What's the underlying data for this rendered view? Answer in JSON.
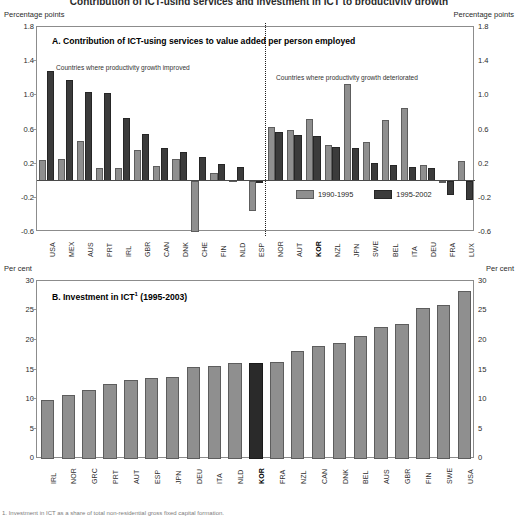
{
  "figure": {
    "title_fragment": "Contribution of ICT-using services and investment in ICT to productivity growth",
    "footer_fragment": "1. Investment in ICT as a share of total non-residential gross fixed capital formation."
  },
  "panelA": {
    "title": "A. Contribution of ICT-using services to value added per person employed",
    "unit_left": "Percentage points",
    "unit_right": "Percentage points",
    "note_left": "Countries where productivity growth improved",
    "note_right": "Countries where productivity growth deteriorated",
    "yticks": [
      "1.8",
      "1.4",
      "1.0",
      "0.6",
      "0.2",
      "-0.2",
      "-0.6"
    ],
    "legend": [
      {
        "label": "1990-1995",
        "style": "light"
      },
      {
        "label": "1995-2002",
        "style": "dark"
      }
    ]
  },
  "panelB": {
    "title": "B. Investment in ICT¹ (1995-2003)",
    "title_main": "B. Investment in ICT",
    "title_sup": "1",
    "title_tail": " (1995-2003)",
    "unit_left": "Per cent",
    "unit_right": "Per cent",
    "yticks": [
      "30",
      "25",
      "20",
      "15",
      "10",
      "5",
      "0"
    ]
  },
  "chart_data": [
    {
      "type": "bar",
      "title": "A. Contribution of ICT-using services to value added per person employed",
      "xlabel": "",
      "ylabel": "Percentage points",
      "ylim": [
        -0.6,
        1.8
      ],
      "yticks": [
        -0.6,
        -0.2,
        0.2,
        0.6,
        1.0,
        1.4,
        1.8
      ],
      "grid": false,
      "legend_position": "inside-bottom-right",
      "annotations": [
        "Countries where productivity growth improved",
        "Countries where productivity growth deteriorated"
      ],
      "group_split_after": "ESP",
      "categories": [
        "USA",
        "MEX",
        "AUS",
        "PRT",
        "IRL",
        "GBR",
        "CAN",
        "DNK",
        "CHE",
        "FIN",
        "NLD",
        "ESP",
        "NOR",
        "AUT",
        "KOR",
        "NZL",
        "JPN",
        "SWE",
        "BEL",
        "ITA",
        "DEU",
        "FRA",
        "LUX"
      ],
      "series": [
        {
          "name": "1990-1995",
          "color": "#8f8f8f",
          "values": [
            0.24,
            0.25,
            0.47,
            0.15,
            0.15,
            0.36,
            0.17,
            0.25,
            -0.6,
            0.09,
            0.0,
            -0.35,
            0.63,
            0.6,
            0.72,
            0.42,
            1.13,
            0.45,
            0.71,
            0.85,
            0.19,
            -0.02,
            0.23
          ]
        },
        {
          "name": "1995-2002",
          "color": "#3b3b3b",
          "values": [
            1.29,
            1.18,
            1.04,
            1.03,
            0.73,
            0.55,
            0.38,
            0.34,
            0.28,
            0.2,
            0.16,
            -0.02,
            0.57,
            0.53,
            0.52,
            0.4,
            0.38,
            0.21,
            0.18,
            0.16,
            0.15,
            -0.17,
            -0.22
          ]
        }
      ]
    },
    {
      "type": "bar",
      "title": "B. Investment in ICT¹ (1995-2003)",
      "xlabel": "",
      "ylabel": "Per cent",
      "ylim": [
        0,
        30
      ],
      "yticks": [
        0,
        5,
        10,
        15,
        20,
        25,
        30
      ],
      "grid": false,
      "highlight": "KOR",
      "categories": [
        "IRL",
        "NOR",
        "GRC",
        "PRT",
        "AUT",
        "ESP",
        "JPN",
        "DEU",
        "ITA",
        "NLD",
        "KOR",
        "FRA",
        "NZL",
        "CAN",
        "DNK",
        "BEL",
        "AUS",
        "GBR",
        "FIN",
        "SWE",
        "USA"
      ],
      "values": [
        10.0,
        10.8,
        11.6,
        12.6,
        13.3,
        13.6,
        13.9,
        15.5,
        15.6,
        16.1,
        16.1,
        16.3,
        18.2,
        19.1,
        19.6,
        20.8,
        22.3,
        22.8,
        25.4,
        25.9,
        28.3
      ]
    }
  ]
}
